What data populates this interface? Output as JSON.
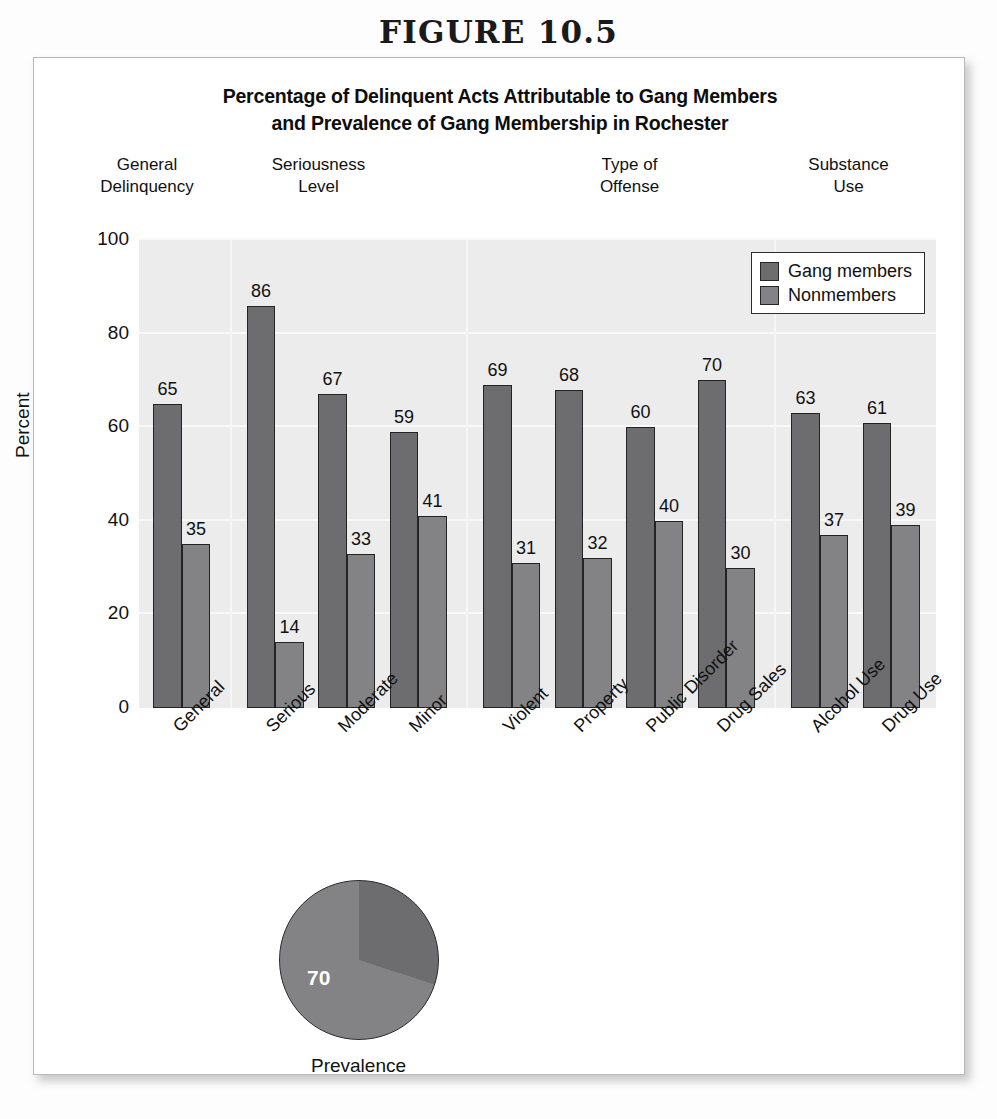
{
  "figure": {
    "number_label": "FIGURE 10.5"
  },
  "chart_data": {
    "type": "bar",
    "title": "Percentage of Delinquent Acts Attributable to Gang Members and Prevalence of Gang Membership in Rochester",
    "title_line1": "Percentage of Delinquent Acts Attributable to Gang Members",
    "title_line2": "and Prevalence of Gang Membership in Rochester",
    "xlabel": "",
    "ylabel": "Percent",
    "ylim": [
      0,
      100
    ],
    "yticks": [
      0,
      20,
      40,
      60,
      80,
      100
    ],
    "ytick_labels": [
      "0",
      "20",
      "40",
      "60",
      "80",
      "100"
    ],
    "grid": true,
    "legend_position": "top-right",
    "categories": [
      "General",
      "Serious",
      "Moderate",
      "Minor",
      "Violent",
      "Property",
      "Public Disorder",
      "Drug Sales",
      "Alcohol Use",
      "Drug Use"
    ],
    "groups": [
      {
        "label_line1": "General",
        "label_line2": "Delinquency",
        "categories": [
          "General"
        ]
      },
      {
        "label_line1": "Seriousness",
        "label_line2": "Level",
        "categories": [
          "Serious",
          "Moderate",
          "Minor"
        ]
      },
      {
        "label_line1": "Type of",
        "label_line2": "Offense",
        "categories": [
          "Violent",
          "Property",
          "Public Disorder",
          "Drug Sales"
        ]
      },
      {
        "label_line1": "Substance",
        "label_line2": "Use",
        "categories": [
          "Alcohol Use",
          "Drug Use"
        ]
      }
    ],
    "series": [
      {
        "name": "Gang members",
        "color": "#6d6d6f",
        "values": [
          65,
          86,
          67,
          59,
          69,
          68,
          60,
          70,
          63,
          61
        ]
      },
      {
        "name": "Nonmembers",
        "color": "#838385",
        "values": [
          35,
          14,
          33,
          41,
          31,
          32,
          40,
          30,
          37,
          39
        ]
      }
    ]
  },
  "pie_chart": {
    "type": "pie",
    "caption": "Prevalence",
    "slices": [
      {
        "label": "70",
        "value": 70,
        "color": "#838385",
        "show_label": true
      },
      {
        "label": "",
        "value": 30,
        "color": "#6d6d6f",
        "show_label": false
      }
    ],
    "displayed_value": "70"
  },
  "colors": {
    "gang_members": "#6d6d6f",
    "nonmembers": "#838385",
    "plot_background": "#ececec",
    "card_background": "#ffffff",
    "text": "#111111"
  }
}
